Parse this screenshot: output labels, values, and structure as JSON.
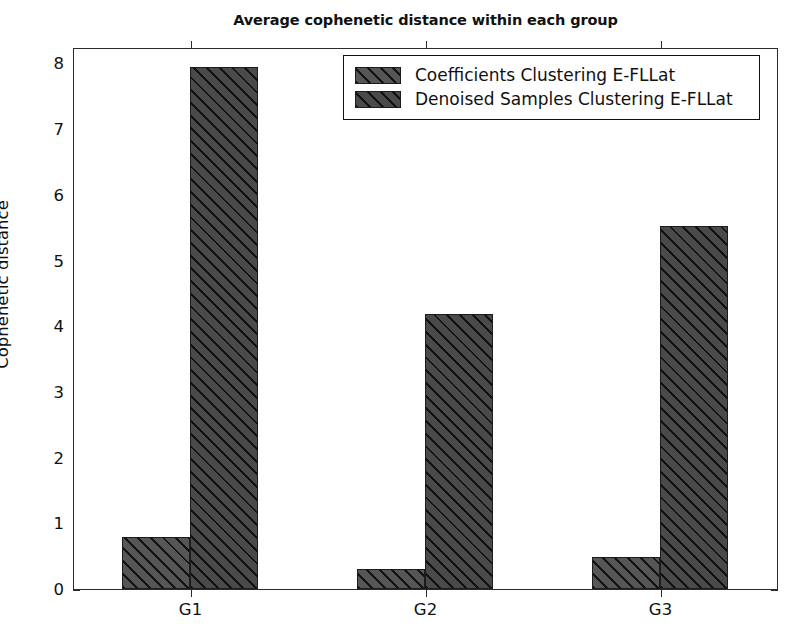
{
  "chart_data": {
    "type": "bar",
    "title": "Average cophenetic distance within each group",
    "xlabel": "",
    "ylabel": "Cophenetic distance",
    "categories": [
      "G1",
      "G2",
      "G3"
    ],
    "series": [
      {
        "name": "Coefficients Clustering E-FLLat",
        "values": [
          0.79,
          0.3,
          0.48
        ],
        "color": "#565656",
        "hatch": "/"
      },
      {
        "name": "Denoised Samples Clustering E-FLLat",
        "values": [
          7.95,
          4.18,
          5.52
        ],
        "color": "#4a4a4a",
        "hatch": "/"
      }
    ],
    "ylim": [
      0,
      8.25
    ],
    "yticks": [
      0,
      1,
      2,
      3,
      4,
      5,
      6,
      7,
      8
    ],
    "ytick_labels": [
      "0",
      "1",
      "2",
      "3",
      "4",
      "5",
      "6",
      "7",
      "8"
    ],
    "xtick_labels": [
      "G1",
      "G2",
      "G3"
    ],
    "grid": false,
    "legend_position": "upper center"
  },
  "legend": {
    "entries": [
      {
        "label": "Coefficients Clustering E-FLLat"
      },
      {
        "label": "Denoised Samples Clustering E-FLLat"
      }
    ]
  }
}
